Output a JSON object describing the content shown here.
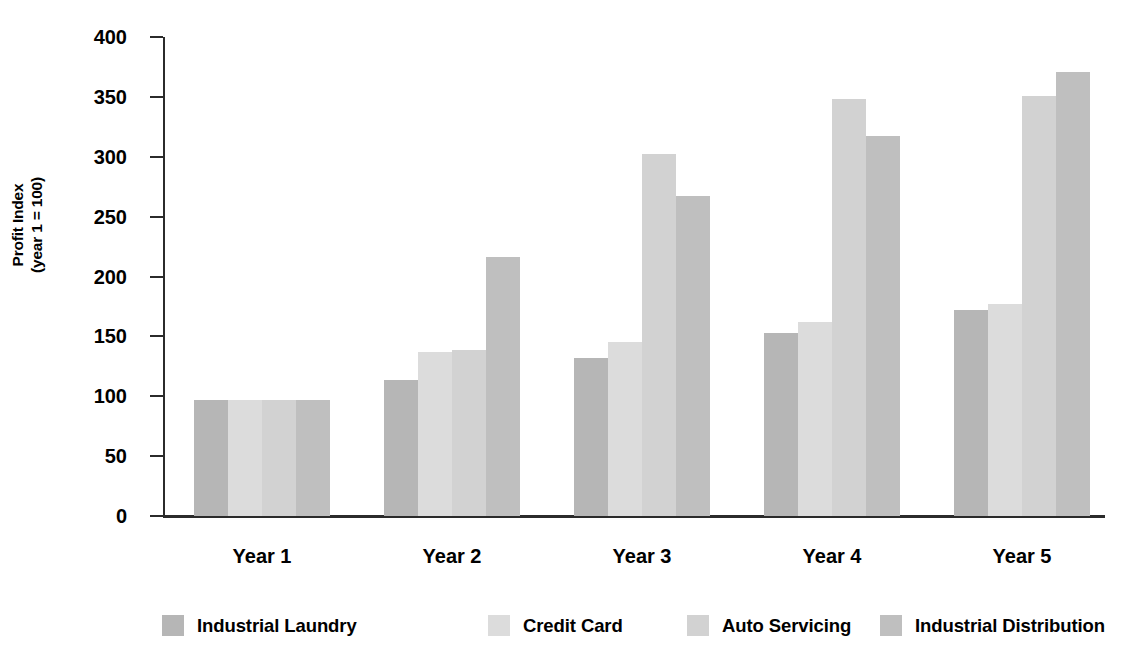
{
  "chart_data": {
    "type": "bar",
    "title": "",
    "subtitle": "",
    "xlabel": "",
    "ylabel": "Profit Index (year 1 = 100)",
    "ylabel_line1": "Profit Index",
    "ylabel_line2": "(year 1 = 100)",
    "categories": [
      "Year 1",
      "Year 2",
      "Year 3",
      "Year 4",
      "Year 5"
    ],
    "ylim": [
      0,
      400
    ],
    "yticks": [
      0,
      50,
      100,
      150,
      200,
      250,
      300,
      350,
      400
    ],
    "ytick_labels": [
      "0",
      "50",
      "100",
      "150",
      "200",
      "250",
      "300",
      "350",
      "400"
    ],
    "grid": false,
    "legend_position": "bottom",
    "series": [
      {
        "name": "Industrial Laundry",
        "color": "#b6b6b6",
        "values": [
          97,
          114,
          132,
          153,
          172
        ]
      },
      {
        "name": "Credit Card",
        "color": "#dcdcdc",
        "values": [
          97,
          137,
          145,
          162,
          177
        ]
      },
      {
        "name": "Auto Servicing",
        "color": "#d2d2d2",
        "values": [
          97,
          139,
          302,
          348,
          351
        ]
      },
      {
        "name": "Industrial Distribution",
        "color": "#bfbfbf",
        "values": [
          97,
          216,
          267,
          317,
          371
        ]
      }
    ]
  },
  "axis": {
    "line_color": "#2b2b2b"
  }
}
